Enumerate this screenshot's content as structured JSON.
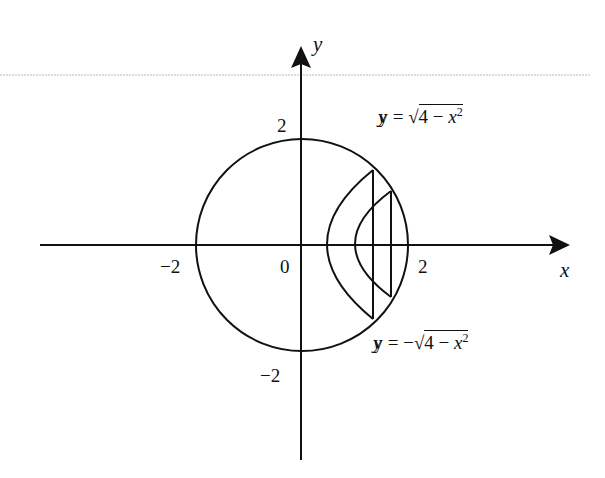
{
  "diagram": {
    "axes": {
      "x_label": "x",
      "y_label": "y",
      "x_ticks": [
        "−2",
        "2"
      ],
      "y_ticks": [
        "2",
        "−2"
      ],
      "origin_label": "0"
    },
    "curves": {
      "upper": {
        "lhs": "y = ",
        "sign": "",
        "radicand_num": "4 − ",
        "radicand_var": "x",
        "exp": "2"
      },
      "lower": {
        "lhs": "y = ",
        "sign": "−",
        "radicand_num": "4 − ",
        "radicand_var": "x",
        "exp": "2"
      }
    },
    "shapes": [
      "circle of radius 2 centered at origin",
      "outer shifted arc with vertical chord",
      "inner shifted arc with vertical chord"
    ],
    "colors": {
      "stroke": "#111111",
      "background": "#ffffff"
    }
  }
}
